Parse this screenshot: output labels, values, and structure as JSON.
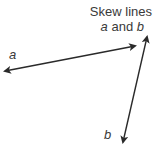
{
  "title": {
    "line1": "Skew lines",
    "line2_var1": "a",
    "line2_and": " and ",
    "line2_var2": "b"
  },
  "lines": [
    {
      "name": "a",
      "label": "a",
      "start": [
        5,
        71
      ],
      "end": [
        135,
        46
      ],
      "arrows": "both",
      "color": "#2a2a2a"
    },
    {
      "name": "b",
      "label": "b",
      "start": [
        147,
        37
      ],
      "end": [
        123,
        142
      ],
      "arrows": "both",
      "color": "#2a2a2a"
    }
  ],
  "labels": {
    "a": "a",
    "b": "b"
  }
}
